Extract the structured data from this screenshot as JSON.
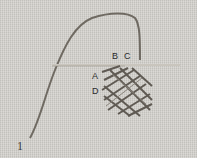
{
  "image": {
    "description": "Embroidery stitch instruction photo on linen fabric",
    "labels": [
      {
        "id": "B",
        "text": "B"
      },
      {
        "id": "C",
        "text": "C"
      },
      {
        "id": "A",
        "text": "A"
      },
      {
        "id": "D",
        "text": "D"
      }
    ],
    "step_number": "1",
    "colors": {
      "fabric": "#d3d1cc",
      "thread": "#6f6a62",
      "needle": "#c9c5bd"
    }
  }
}
